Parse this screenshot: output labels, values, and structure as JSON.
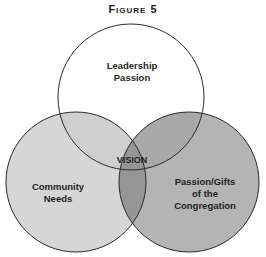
{
  "figure": {
    "title": "Figure 5",
    "circles": [
      {
        "name": "Leadership Passion",
        "lines": [
          "Leadership",
          "Passion"
        ],
        "fill": "#ffffff"
      },
      {
        "name": "Community Needs",
        "lines": [
          "Community",
          "Needs"
        ],
        "fill": "#d6d6d6"
      },
      {
        "name": "Passion/Gifts of the Congregation",
        "lines": [
          "Passion/Gifts",
          "of the",
          "Congregation"
        ],
        "fill": "#b4b4b4"
      }
    ],
    "center_label": "VISION",
    "colors": {
      "stroke": "#2a2a2a",
      "overlap_bottom": "#969696",
      "overlap_top_left": "#cfcfcf",
      "overlap_top_right": "#a9a9a9"
    }
  }
}
